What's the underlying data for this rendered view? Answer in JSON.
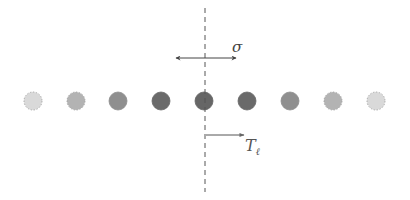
{
  "diagram": {
    "labels": {
      "sigma": "σ",
      "translation": "T",
      "translation_sub": "ℓ"
    },
    "axis": {
      "x": 205,
      "y_top": 8,
      "y_bottom": 192,
      "color": "#555555"
    },
    "sigma_arrow": {
      "y": 58,
      "x1": 176,
      "x2": 236,
      "color": "#444444"
    },
    "translation_arrow": {
      "y": 135,
      "x1": 206,
      "x2": 244,
      "color": "#555555"
    },
    "circles": [
      {
        "cx": 33,
        "cy": 101,
        "r": 9,
        "fill": "#d9d9d9",
        "dashed": true
      },
      {
        "cx": 76,
        "cy": 101,
        "r": 9,
        "fill": "#b3b3b3",
        "dashed": true
      },
      {
        "cx": 118,
        "cy": 101,
        "r": 9,
        "fill": "#8f8f8f",
        "dashed": false
      },
      {
        "cx": 161,
        "cy": 101,
        "r": 9,
        "fill": "#6a6a6a",
        "dashed": false
      },
      {
        "cx": 204,
        "cy": 101,
        "r": 9,
        "fill": "#666666",
        "dashed": false
      },
      {
        "cx": 247,
        "cy": 101,
        "r": 9,
        "fill": "#6a6a6a",
        "dashed": false
      },
      {
        "cx": 290,
        "cy": 101,
        "r": 9,
        "fill": "#8f8f8f",
        "dashed": false
      },
      {
        "cx": 333,
        "cy": 101,
        "r": 9,
        "fill": "#b3b3b3",
        "dashed": true
      },
      {
        "cx": 376,
        "cy": 101,
        "r": 9,
        "fill": "#d9d9d9",
        "dashed": true
      }
    ]
  }
}
